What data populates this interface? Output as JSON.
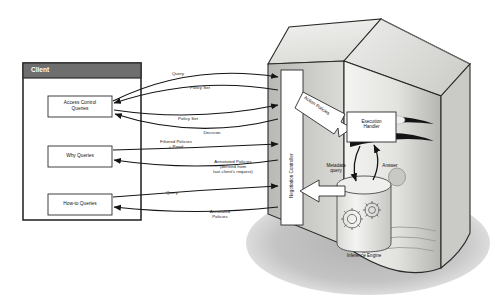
{
  "diagram": {
    "client": {
      "header": "Client",
      "boxes": [
        {
          "id": "access-control-queries",
          "label": "Access Control\nQueries"
        },
        {
          "id": "why-queries",
          "label": "Why Queries"
        },
        {
          "id": "how-to-queries",
          "label": "How-to Queries"
        }
      ]
    },
    "server": {
      "negotiation_controller": "Negotiation Controller",
      "action_policies": "Action Policies",
      "execution_handler": "Execution\nHandler",
      "metadata_query": "Metadata\nquery",
      "answer": "Answer",
      "inference_engine": "Inference Engine"
    },
    "edges": [
      {
        "id": "query-1",
        "label": "Query",
        "direction": "client-to-server"
      },
      {
        "id": "policy-set-1",
        "label": "Policy Set",
        "direction": "server-to-client"
      },
      {
        "id": "policy-set-2",
        "label": "Policy Set",
        "direction": "client-to-server"
      },
      {
        "id": "decision",
        "label": "Decision",
        "direction": "server-to-client"
      },
      {
        "id": "filtered-policies",
        "label": "Filtered Policies\n+ Proof",
        "direction": "server-to-client"
      },
      {
        "id": "annotated-policies-derived",
        "label": "Annotated Policies\n(derived from\nlast client's request)",
        "direction": "server-to-client"
      },
      {
        "id": "query-2",
        "label": "Query",
        "direction": "client-to-server"
      },
      {
        "id": "annotated-policies",
        "label": "Annotated\nPolicies",
        "direction": "server-to-client"
      }
    ],
    "colors": {
      "client_header": "#6e6e6e",
      "client_border": "#2b2b2b",
      "box_fill": "#ffffff",
      "tower_light": "#e8e8e6",
      "tower_mid": "#d2d2cf",
      "tower_dark": "#9a9a97",
      "shadow": "#b9b9b9",
      "line": "#1a1a1a"
    }
  }
}
